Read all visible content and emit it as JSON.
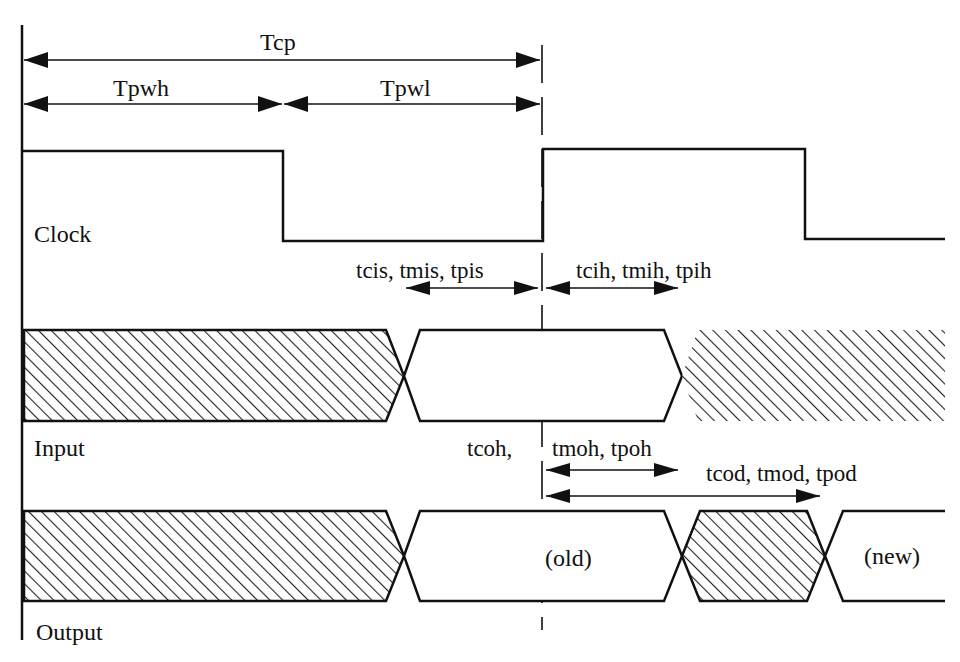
{
  "diagram": {
    "type": "timing-diagram",
    "signals": [
      {
        "name": "Clock",
        "label": "Clock"
      },
      {
        "name": "Input",
        "label": "Input"
      },
      {
        "name": "Output",
        "label": "Output"
      }
    ],
    "timing_labels": {
      "clock_period": "Tcp",
      "pulse_width_high": "Tpwh",
      "pulse_width_low": "Tpwl",
      "setup": "tcis, tmis, tpis",
      "hold": "tcih, tmih, tpih",
      "output_hold_prefix": "tcoh,",
      "output_hold": "tmoh, tpoh",
      "output_delay": "tcod, tmod, tpod"
    },
    "output_states": {
      "old": "(old)",
      "new": "(new)"
    },
    "colors": {
      "line": "#111111",
      "background": "#ffffff",
      "hatch": "#222222"
    }
  }
}
